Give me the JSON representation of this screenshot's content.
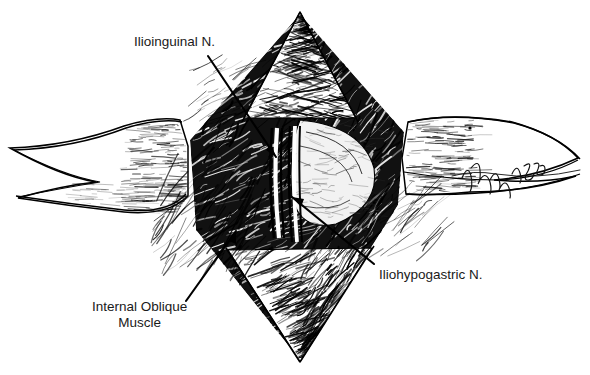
{
  "figure": {
    "kind": "pen-and-ink surgical anatomy illustration",
    "background_color": "#ffffff",
    "ink_color": "#000000",
    "label_color": "#1a1a1a",
    "signature": {
      "text": "95",
      "style": "cursive artist signature ending in 95",
      "x": 466,
      "y": 162
    }
  },
  "labels": [
    {
      "name": "ilioinguinal-nerve",
      "text": "Ilioinguinal N.",
      "x": 134,
      "y": 34,
      "align": "left",
      "leader": {
        "x1": 208,
        "y1": 56,
        "x2": 276,
        "y2": 157,
        "arrow": "end"
      }
    },
    {
      "name": "iliohypogastric-nerve",
      "text": "Iliohypogastric N.",
      "x": 379,
      "y": 267,
      "align": "left",
      "leader": {
        "x1": 374,
        "y1": 264,
        "x2": 292,
        "y2": 197,
        "arrow": "end"
      }
    },
    {
      "name": "internal-oblique-muscle",
      "text_line1": "Internal Oblique",
      "text_line2": "Muscle",
      "x": 92,
      "y": 299,
      "align": "center",
      "leader": {
        "x1": 186,
        "y1": 301,
        "x2": 236,
        "y2": 231,
        "arrow": "end"
      }
    }
  ],
  "structures": [
    {
      "name": "wound-cavity",
      "description": "diamond-shaped open surgical wound, dense black cross-hatching"
    },
    {
      "name": "left-retractor",
      "description": "white tapered surgical retractor blade entering from left"
    },
    {
      "name": "right-retractor",
      "description": "white tapered surgical retractor blade entering from right"
    },
    {
      "name": "superior-apex",
      "description": "upper pointed apex of incision with fine transverse hatch"
    },
    {
      "name": "inferior-apex",
      "description": "lower pointed apex of incision with sweeping hatch"
    },
    {
      "name": "ilioinguinal-cord",
      "description": "pale vertical nerve cord, left of midline"
    },
    {
      "name": "iliohypogastric-cord",
      "description": "pale vertical nerve cord, right of the ilioinguinal"
    },
    {
      "name": "inguinal-floor",
      "description": "pale rounded floor of the inguinal canal, right of nerves"
    }
  ]
}
